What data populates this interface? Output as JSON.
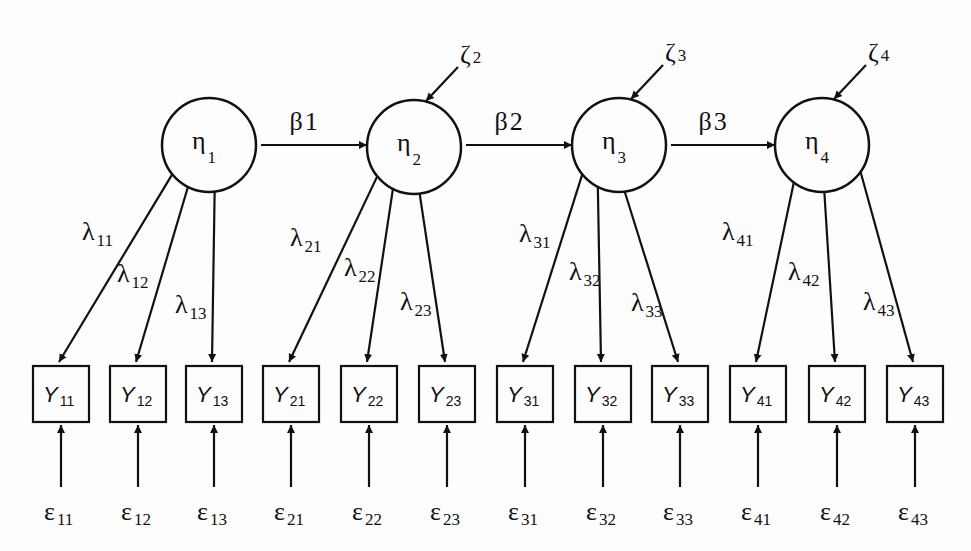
{
  "diagram": {
    "type": "structural-equation-model",
    "latents": [
      {
        "id": "eta1",
        "symbol": "η",
        "sub": "1"
      },
      {
        "id": "eta2",
        "symbol": "η",
        "sub": "2"
      },
      {
        "id": "eta3",
        "symbol": "η",
        "sub": "3"
      },
      {
        "id": "eta4",
        "symbol": "η",
        "sub": "4"
      }
    ],
    "structural_paths": [
      {
        "from": "eta1",
        "to": "eta2",
        "symbol": "β",
        "sub": "1"
      },
      {
        "from": "eta2",
        "to": "eta3",
        "symbol": "β",
        "sub": "2"
      },
      {
        "from": "eta3",
        "to": "eta4",
        "symbol": "β",
        "sub": "3"
      }
    ],
    "disturbances": [
      {
        "to": "eta2",
        "symbol": "ζ",
        "sub": "2"
      },
      {
        "to": "eta3",
        "symbol": "ζ",
        "sub": "3"
      },
      {
        "to": "eta4",
        "symbol": "ζ",
        "sub": "4"
      }
    ],
    "indicators": [
      {
        "latent": "eta1",
        "symbol": "Y",
        "sub": "11",
        "loading": {
          "symbol": "λ",
          "sub": "11"
        },
        "error": {
          "symbol": "ε",
          "sub": "11"
        }
      },
      {
        "latent": "eta1",
        "symbol": "Y",
        "sub": "12",
        "loading": {
          "symbol": "λ",
          "sub": "12"
        },
        "error": {
          "symbol": "ε",
          "sub": "12"
        }
      },
      {
        "latent": "eta1",
        "symbol": "Y",
        "sub": "13",
        "loading": {
          "symbol": "λ",
          "sub": "13"
        },
        "error": {
          "symbol": "ε",
          "sub": "13"
        }
      },
      {
        "latent": "eta2",
        "symbol": "Y",
        "sub": "21",
        "loading": {
          "symbol": "λ",
          "sub": "21"
        },
        "error": {
          "symbol": "ε",
          "sub": "21"
        }
      },
      {
        "latent": "eta2",
        "symbol": "Y",
        "sub": "22",
        "loading": {
          "symbol": "λ",
          "sub": "22"
        },
        "error": {
          "symbol": "ε",
          "sub": "22"
        }
      },
      {
        "latent": "eta2",
        "symbol": "Y",
        "sub": "23",
        "loading": {
          "symbol": "λ",
          "sub": "23"
        },
        "error": {
          "symbol": "ε",
          "sub": "23"
        }
      },
      {
        "latent": "eta3",
        "symbol": "Y",
        "sub": "31",
        "loading": {
          "symbol": "λ",
          "sub": "31"
        },
        "error": {
          "symbol": "ε",
          "sub": "31"
        }
      },
      {
        "latent": "eta3",
        "symbol": "Y",
        "sub": "32",
        "loading": {
          "symbol": "λ",
          "sub": "32"
        },
        "error": {
          "symbol": "ε",
          "sub": "32"
        }
      },
      {
        "latent": "eta3",
        "symbol": "Y",
        "sub": "33",
        "loading": {
          "symbol": "λ",
          "sub": "33"
        },
        "error": {
          "symbol": "ε",
          "sub": "33"
        }
      },
      {
        "latent": "eta4",
        "symbol": "Y",
        "sub": "41",
        "loading": {
          "symbol": "λ",
          "sub": "41"
        },
        "error": {
          "symbol": "ε",
          "sub": "41"
        }
      },
      {
        "latent": "eta4",
        "symbol": "Y",
        "sub": "42",
        "loading": {
          "symbol": "λ",
          "sub": "42"
        },
        "error": {
          "symbol": "ε",
          "sub": "42"
        }
      },
      {
        "latent": "eta4",
        "symbol": "Y",
        "sub": "43",
        "loading": {
          "symbol": "λ",
          "sub": "43"
        },
        "error": {
          "symbol": "ε",
          "sub": "43"
        }
      }
    ]
  }
}
